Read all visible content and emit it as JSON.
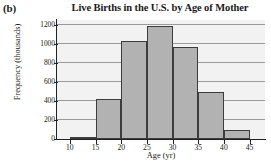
{
  "figure": {
    "part_label": "(b)"
  },
  "chart_data": {
    "type": "bar",
    "title": "Live Births in the U.S. by Age of Mother",
    "xlabel": "Age (yr)",
    "ylabel": "Frequency (thousands)",
    "grid": true,
    "legend": null,
    "xlim": [
      7.5,
      48
    ],
    "ylim": [
      0,
      1250
    ],
    "bin_edges": [
      10,
      15,
      20,
      25,
      30,
      35,
      40,
      45
    ],
    "categories": [
      "10-15",
      "15-20",
      "20-25",
      "25-30",
      "30-35",
      "35-40",
      "40-45"
    ],
    "values": [
      20,
      425,
      1030,
      1190,
      965,
      490,
      95
    ],
    "xticks": [
      10,
      15,
      20,
      25,
      30,
      35,
      40,
      45
    ],
    "xtick_labels": [
      "10",
      "15",
      "20",
      "25",
      "30",
      "35",
      "40",
      "45"
    ],
    "yticks": [
      0,
      200,
      400,
      600,
      800,
      1000,
      1200
    ],
    "ytick_labels": [
      "0",
      "200",
      "400",
      "600",
      "800",
      "1000",
      "1200"
    ],
    "bar_color": "#b2b2b2",
    "bar_edge_color": "#3c3c3c",
    "plot_background": "#f2f2f2",
    "gridline_color": "#9a9a9a"
  }
}
